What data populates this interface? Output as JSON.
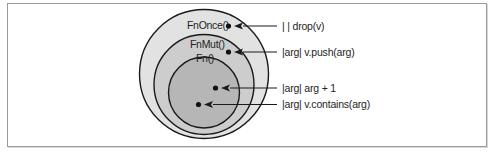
{
  "diagram": {
    "colors": {
      "outer_fill": "#e2e2e2",
      "middle_fill": "#cdcdcd",
      "inner_fill": "#b6b6b6",
      "stroke": "#1a1a1a",
      "frame_border": "#9a9a9a"
    },
    "circles": [
      {
        "id": "fnonce",
        "label": "FnOnce()"
      },
      {
        "id": "fnmut",
        "label": "FnMut()"
      },
      {
        "id": "fn",
        "label": "Fn()"
      }
    ],
    "examples": [
      {
        "text": "| | drop(v)",
        "belongs_to": "FnOnce()"
      },
      {
        "text": "|arg| v.push(arg)",
        "belongs_to": "FnMut()"
      },
      {
        "text": "|arg| arg + 1",
        "belongs_to": "Fn()"
      },
      {
        "text": "|arg| v.contains(arg)",
        "belongs_to": "Fn()"
      }
    ]
  }
}
